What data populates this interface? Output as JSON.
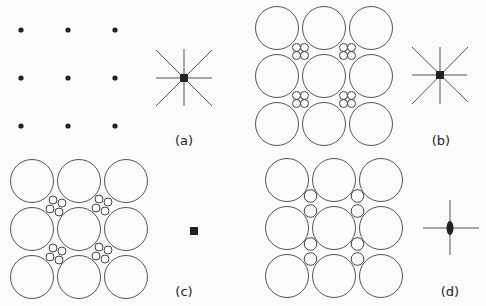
{
  "figure": {
    "panels": [
      {
        "id": "a",
        "label": "(a)",
        "description": "lattice points with cubic (8-arm) site symmetry"
      },
      {
        "id": "b",
        "label": "(b)",
        "description": "large spheres with 4-sphere square clusters in interstices; symmetry retained"
      },
      {
        "id": "c",
        "label": "(c)",
        "description": "large spheres with rotated 4-sphere clusters; symmetry reduced to a point"
      },
      {
        "id": "d",
        "label": "(d)",
        "description": "large spheres with vertical pairs of small spheres; reduced 2-fold symmetry"
      }
    ]
  },
  "colors": {
    "ink": "#222222",
    "line": "#555555",
    "background": "#fbfbfb"
  }
}
